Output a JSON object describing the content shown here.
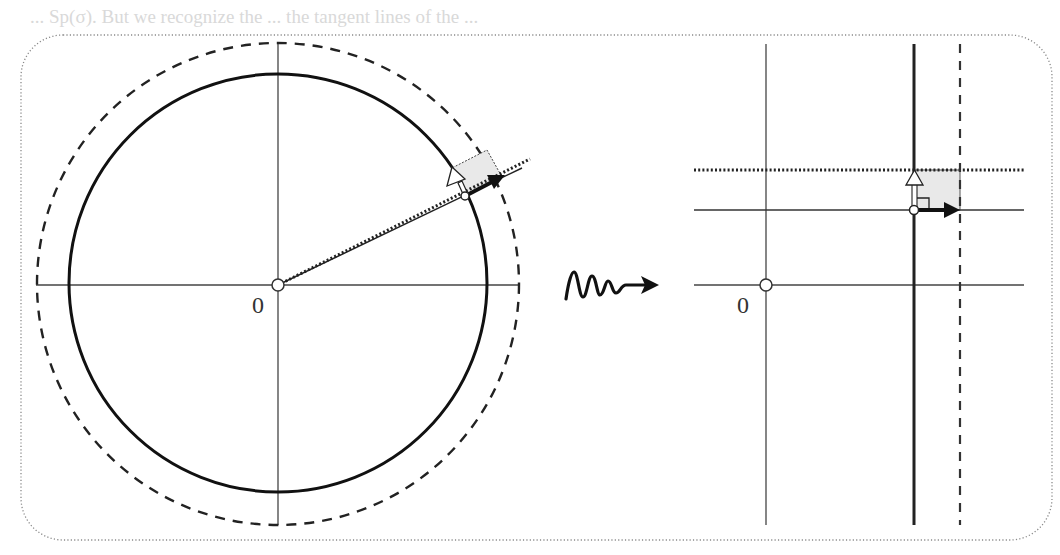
{
  "figure": {
    "background_text": [
      {
        "text": "... Sp(σ). But we recognize the ... the tangent lines of the ...",
        "x": 30,
        "y": 6
      },
      {
        "text": "tangent lines ... Then",
        "x": 590,
        "y": 40
      }
    ],
    "left_panel": {
      "origin_label": "0",
      "center": [
        278,
        285
      ],
      "solid_circle_radius": 210,
      "dashed_circle_radius": 240,
      "solid_ray_end": [
        522,
        169
      ],
      "dotted_ray_end": [
        530,
        160
      ],
      "point_on_circle": [
        465,
        196
      ],
      "white_arrow_tip": [
        452,
        168
      ],
      "black_arrow_tip": [
        502,
        176
      ]
    },
    "transition_arrow": {
      "icon": "squiggle-arrow-icon"
    },
    "right_panel": {
      "origin_label": "0",
      "origin": [
        766,
        285
      ],
      "thick_vertical_x": 914,
      "dashed_vertical_x": 960,
      "dotted_horizontal_y": 170,
      "solid_horizontal_y": 210,
      "point": [
        914,
        210
      ]
    },
    "colors": {
      "line": "#222222",
      "axis": "#444444",
      "shade": "#e9e9e9",
      "frame": "#888888"
    }
  }
}
